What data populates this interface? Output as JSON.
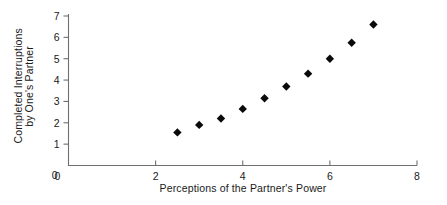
{
  "chart_data": {
    "type": "scatter",
    "title": "",
    "xlabel": "Perceptions of the Partner's Power",
    "ylabel_line1": "Completed Interruptions",
    "ylabel_line2": "by One's Partner",
    "xlim": [
      0,
      8
    ],
    "ylim": [
      0,
      7
    ],
    "xticks": [
      0,
      2,
      4,
      6,
      8
    ],
    "xticklabels": [
      "0",
      "2",
      "4",
      "6",
      "8"
    ],
    "yticks": [
      0,
      1,
      2,
      3,
      4,
      5,
      6,
      7
    ],
    "yticklabels": [
      "0",
      "1",
      "2",
      "3",
      "4",
      "5",
      "6",
      "7"
    ],
    "grid": false,
    "legend": false,
    "marker": "diamond",
    "marker_color": "#0a0a0a",
    "x": [
      2.5,
      3.0,
      3.5,
      4.0,
      4.5,
      5.0,
      5.5,
      6.0,
      6.5,
      7.0
    ],
    "y": [
      1.55,
      1.9,
      2.2,
      2.65,
      3.15,
      3.7,
      4.3,
      5.0,
      5.75,
      6.6
    ],
    "points": [
      {
        "x": 2.5,
        "y": 1.55
      },
      {
        "x": 3.0,
        "y": 1.9
      },
      {
        "x": 3.5,
        "y": 2.2
      },
      {
        "x": 4.0,
        "y": 2.65
      },
      {
        "x": 4.5,
        "y": 3.15
      },
      {
        "x": 5.0,
        "y": 3.7
      },
      {
        "x": 5.5,
        "y": 4.3
      },
      {
        "x": 6.0,
        "y": 5.0
      },
      {
        "x": 6.5,
        "y": 5.75
      },
      {
        "x": 7.0,
        "y": 6.6
      }
    ]
  },
  "axes": {
    "x_title": "Perceptions of the Partner's Power",
    "y_title_line1": "Completed Interruptions",
    "y_title_line2": "by One's Partner"
  },
  "colors": {
    "axis": "#6f6f6f",
    "text": "#1a1a1a",
    "marker": "#0a0a0a",
    "background": "#ffffff"
  }
}
